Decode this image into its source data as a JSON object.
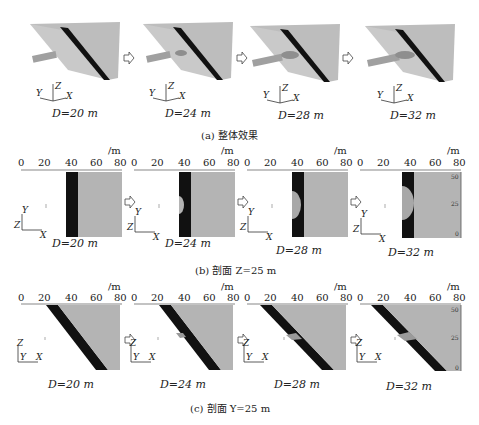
{
  "figure": {
    "row_a": {
      "caption": "(a) 整体效果",
      "panels": [
        {
          "label": "D=20 m",
          "D": 20
        },
        {
          "label": "D=24 m",
          "D": 24
        },
        {
          "label": "D=28 m",
          "D": 28
        },
        {
          "label": "D=32 m",
          "D": 32
        }
      ],
      "axes": {
        "z": "Z",
        "y": "Y",
        "x": "X"
      }
    },
    "row_b": {
      "caption": "(b) 剖面 Z=25 m",
      "panels": [
        {
          "label": "D=20 m",
          "D": 20
        },
        {
          "label": "D=24 m",
          "D": 24
        },
        {
          "label": "D=28 m",
          "D": 28
        },
        {
          "label": "D=32 m",
          "D": 32
        }
      ],
      "x_ticks": [
        "0",
        "20",
        "40",
        "60",
        "80"
      ],
      "unit": "/m",
      "right_ticks": [
        "50",
        "25",
        "0"
      ],
      "axes": {
        "v": "Y",
        "h": "X",
        "o": "Z"
      }
    },
    "row_c": {
      "caption": "(c) 剖面 Y=25 m",
      "panels": [
        {
          "label": "D=20 m",
          "D": 20
        },
        {
          "label": "D=24 m",
          "D": 24
        },
        {
          "label": "D=28 m",
          "D": 28
        },
        {
          "label": "D=32 m",
          "D": 32
        }
      ],
      "x_ticks": [
        "0",
        "20",
        "40",
        "60",
        "80"
      ],
      "unit": "/m",
      "right_ticks": [
        "50",
        "25",
        "0"
      ],
      "axes": {
        "v": "Z",
        "h": "X",
        "o": "Y"
      }
    },
    "colors": {
      "block": "#b4b4b4",
      "block_dark": "#9a9a9a",
      "fault": "#111111",
      "tunnel": "#a0a0a0"
    }
  }
}
